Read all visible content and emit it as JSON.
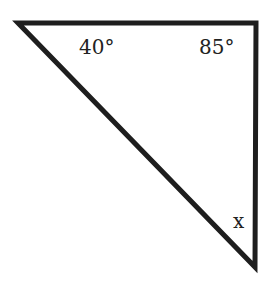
{
  "diagram": {
    "shape": "triangle",
    "stroke_color": "#1e1e1e",
    "angles": [
      {
        "vertex": "top-left",
        "label": "40°"
      },
      {
        "vertex": "top-right",
        "label": "85°"
      },
      {
        "vertex": "bottom",
        "label": "x"
      }
    ]
  }
}
